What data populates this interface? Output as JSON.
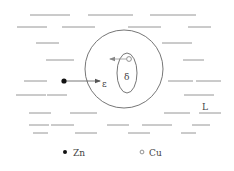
{
  "diagram": {
    "background": "#ffffff",
    "line_color": "#8a8a8a",
    "stroke_color": "#666666",
    "liquid_lines": [
      {
        "x1": 30,
        "x2": 70,
        "y": 15
      },
      {
        "x1": 88,
        "x2": 133,
        "y": 15
      },
      {
        "x1": 150,
        "x2": 196,
        "y": 15
      },
      {
        "x1": 17,
        "x2": 47,
        "y": 27
      },
      {
        "x1": 62,
        "x2": 95,
        "y": 27
      },
      {
        "x1": 128,
        "x2": 161,
        "y": 27
      },
      {
        "x1": 188,
        "x2": 211,
        "y": 27
      },
      {
        "x1": 36,
        "x2": 59,
        "y": 43
      },
      {
        "x1": 162,
        "x2": 192,
        "y": 43
      },
      {
        "x1": 46,
        "x2": 74,
        "y": 60
      },
      {
        "x1": 183,
        "x2": 204,
        "y": 60
      },
      {
        "x1": 24,
        "x2": 47,
        "y": 81
      },
      {
        "x1": 168,
        "x2": 193,
        "y": 81
      },
      {
        "x1": 196,
        "x2": 221,
        "y": 81
      },
      {
        "x1": 16,
        "x2": 46,
        "y": 95
      },
      {
        "x1": 47,
        "x2": 67,
        "y": 95
      },
      {
        "x1": 184,
        "x2": 214,
        "y": 95
      },
      {
        "x1": 29,
        "x2": 51,
        "y": 113
      },
      {
        "x1": 70,
        "x2": 97,
        "y": 113
      },
      {
        "x1": 164,
        "x2": 190,
        "y": 113
      },
      {
        "x1": 199,
        "x2": 221,
        "y": 113
      },
      {
        "x1": 29,
        "x2": 49,
        "y": 125
      },
      {
        "x1": 51,
        "x2": 74,
        "y": 125
      },
      {
        "x1": 107,
        "x2": 129,
        "y": 125
      },
      {
        "x1": 142,
        "x2": 172,
        "y": 125
      },
      {
        "x1": 192,
        "x2": 210,
        "y": 125
      },
      {
        "x1": 33,
        "x2": 48,
        "y": 133
      },
      {
        "x1": 75,
        "x2": 97,
        "y": 133
      },
      {
        "x1": 128,
        "x2": 150,
        "y": 133
      },
      {
        "x1": 181,
        "x2": 196,
        "y": 133
      }
    ],
    "outer_circle": {
      "cx": 124,
      "cy": 69,
      "r": 39
    },
    "inner_ellipse": {
      "cx": 127,
      "cy": 73,
      "rx": 10,
      "ry": 20
    },
    "zn_atom": {
      "cx": 64,
      "cy": 81,
      "r": 2.6
    },
    "zn_arrow": {
      "x1": 66,
      "y1": 81,
      "x2": 100,
      "y2": 81
    },
    "cu_atom": {
      "cx": 129,
      "cy": 59,
      "r": 2.4
    },
    "cu_arrow": {
      "x1": 126,
      "y1": 59,
      "x2": 110,
      "y2": 59
    },
    "labels": {
      "epsilon": "ε",
      "delta": "δ",
      "liquid": "L"
    },
    "legend": {
      "zn_label": "Zn",
      "cu_label": "Cu"
    }
  }
}
